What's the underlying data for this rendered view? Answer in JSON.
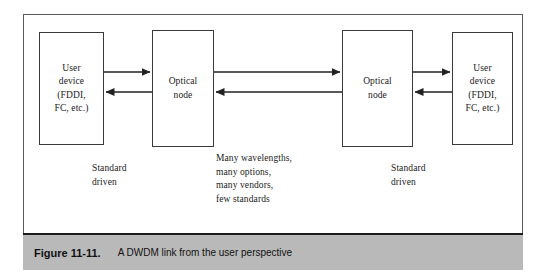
{
  "figure": {
    "caption_number": "Figure 11-11.",
    "caption_text": "A DWDM link from the user perspective",
    "bar_color": "#b9b9b9",
    "frame_color": "#5a5a5a",
    "line_color": "#3a3a3a"
  },
  "diagram": {
    "boxes": [
      {
        "id": "user-device-left",
        "label": "User\ndevice\n(FDDI,\nFC, etc.)"
      },
      {
        "id": "optical-node-left",
        "label": "Optical\nnode"
      },
      {
        "id": "optical-node-right",
        "label": "Optical\nnode"
      },
      {
        "id": "user-device-right",
        "label": "User\ndevice\n(FDDI,\nFC, etc.)"
      }
    ],
    "annotations": [
      {
        "id": "standard-driven-left",
        "text": "Standard\ndriven"
      },
      {
        "id": "dwdm-properties",
        "text": "Many wavelengths,\nmany options,\nmany vendors,\nfew standards"
      },
      {
        "id": "standard-driven-right",
        "text": "Standard\ndriven"
      }
    ],
    "arrows": [
      {
        "id": "left-access-forward",
        "direction": "right"
      },
      {
        "id": "left-access-reverse",
        "direction": "left"
      },
      {
        "id": "dwdm-trunk-forward",
        "direction": "right"
      },
      {
        "id": "dwdm-trunk-reverse",
        "direction": "left"
      },
      {
        "id": "right-access-forward",
        "direction": "right"
      },
      {
        "id": "right-access-reverse",
        "direction": "left"
      }
    ]
  }
}
